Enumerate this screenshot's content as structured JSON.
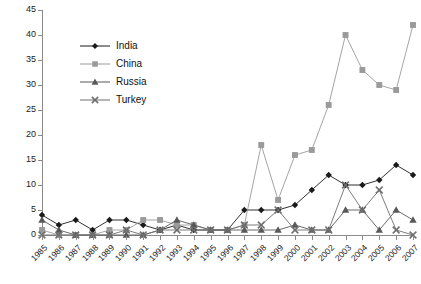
{
  "chart_data": {
    "type": "line",
    "title": "",
    "subtitle": "",
    "xlabel": "",
    "ylabel": "",
    "ylim": [
      0,
      45
    ],
    "yticks": [
      0,
      5,
      10,
      15,
      20,
      25,
      30,
      35,
      40,
      45
    ],
    "grid": false,
    "legend_position": "inside upper-left",
    "categories": [
      "1985",
      "1986",
      "1987",
      "1988",
      "1989",
      "1990",
      "1991",
      "1992",
      "1993",
      "1994",
      "1995",
      "1996",
      "1997",
      "1998",
      "1999",
      "2000",
      "2001",
      "2002",
      "2003",
      "2004",
      "2005",
      "2006",
      "2007"
    ],
    "series": [
      {
        "name": "India",
        "color": "#1a1a1a",
        "marker": "diamond",
        "values": [
          4,
          2,
          3,
          1,
          3,
          3,
          2,
          1,
          2,
          1,
          1,
          1,
          5,
          5,
          5,
          6,
          9,
          12,
          10,
          10,
          11,
          14,
          12
        ]
      },
      {
        "name": "China",
        "color": "#9a9a9a",
        "marker": "square",
        "values": [
          1,
          0,
          0,
          0,
          1,
          1,
          3,
          3,
          2,
          2,
          1,
          1,
          2,
          18,
          7,
          16,
          17,
          26,
          40,
          33,
          30,
          29,
          42
        ]
      },
      {
        "name": "Russia",
        "color": "#595959",
        "marker": "triangle",
        "values": [
          3,
          1,
          0,
          0,
          0,
          0,
          0,
          1,
          3,
          2,
          1,
          1,
          1,
          1,
          1,
          2,
          1,
          1,
          5,
          5,
          1,
          5,
          3
        ]
      },
      {
        "name": "Turkey",
        "color": "#6e6e6e",
        "marker": "x",
        "values": [
          0,
          0,
          0,
          0,
          0,
          1,
          0,
          1,
          1,
          1,
          1,
          1,
          2,
          2,
          5,
          1,
          1,
          1,
          10,
          5,
          9,
          1,
          0
        ]
      }
    ]
  },
  "legend": {
    "items": [
      {
        "label": "India"
      },
      {
        "label": "China"
      },
      {
        "label": "Russia"
      },
      {
        "label": "Turkey"
      }
    ]
  }
}
